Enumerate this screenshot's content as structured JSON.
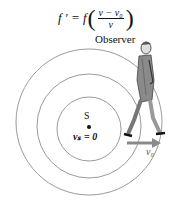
{
  "diagram": {
    "formula": {
      "lhs": "f ′ = f",
      "numerator": "v − v₀",
      "denominator": "v"
    },
    "labels": {
      "observer": "Observer",
      "source": "S",
      "source_velocity": "vₛ = 0",
      "observer_velocity": "v₀"
    },
    "source_center": [
      89,
      127
    ],
    "wavefront_radii": [
      32,
      53,
      73
    ],
    "colors": {
      "wavefront": "#9a9a9a",
      "arrow": "#8a8a8a",
      "text": "#111111",
      "figure": "#555555"
    }
  }
}
